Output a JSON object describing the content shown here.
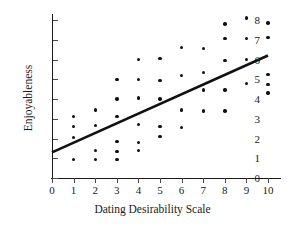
{
  "chart_data": {
    "type": "scatter",
    "title": "",
    "xlabel": "Dating Desirability Scale",
    "ylabel": "Enjoyableness",
    "xlim": [
      0,
      10
    ],
    "ylim": [
      0,
      8
    ],
    "xticks": [
      0,
      1,
      2,
      3,
      4,
      5,
      6,
      7,
      8,
      9,
      10
    ],
    "yticks": [
      0,
      1,
      2,
      3,
      4,
      5,
      6,
      7,
      8
    ],
    "xtick_labels": [
      "0",
      "1",
      "2",
      "3",
      "4",
      "5",
      "6",
      "7",
      "8",
      "9",
      "10"
    ],
    "ytick_labels": [
      "0",
      "1",
      "2",
      "3",
      "4",
      "5",
      "6",
      "7",
      "8"
    ],
    "grid": false,
    "legend": false,
    "marker_color": "#111111",
    "line_color": "#111111",
    "axis_color": "#1a1a1a",
    "background_color": "#ffffff",
    "points": [
      {
        "x": 1,
        "y": 3.1
      },
      {
        "x": 1,
        "y": 2.6
      },
      {
        "x": 1,
        "y": 2.05
      },
      {
        "x": 1,
        "y": 0.95
      },
      {
        "x": 2,
        "y": 3.45
      },
      {
        "x": 2,
        "y": 2.65
      },
      {
        "x": 2,
        "y": 1.4
      },
      {
        "x": 2,
        "y": 0.95
      },
      {
        "x": 3,
        "y": 5.0
      },
      {
        "x": 3,
        "y": 4.0
      },
      {
        "x": 3,
        "y": 3.1
      },
      {
        "x": 3,
        "y": 1.85
      },
      {
        "x": 3,
        "y": 1.35
      },
      {
        "x": 3,
        "y": 0.95
      },
      {
        "x": 4,
        "y": 6.0
      },
      {
        "x": 4,
        "y": 5.0
      },
      {
        "x": 4,
        "y": 4.05
      },
      {
        "x": 4,
        "y": 2.7
      },
      {
        "x": 4,
        "y": 1.8
      },
      {
        "x": 4,
        "y": 1.4
      },
      {
        "x": 5,
        "y": 6.05
      },
      {
        "x": 5,
        "y": 4.95
      },
      {
        "x": 5,
        "y": 4.0
      },
      {
        "x": 5,
        "y": 2.6
      },
      {
        "x": 5,
        "y": 2.1
      },
      {
        "x": 6,
        "y": 6.6
      },
      {
        "x": 6,
        "y": 5.2
      },
      {
        "x": 6,
        "y": 3.45
      },
      {
        "x": 6,
        "y": 2.55
      },
      {
        "x": 7,
        "y": 6.55
      },
      {
        "x": 7,
        "y": 5.35
      },
      {
        "x": 7,
        "y": 4.45
      },
      {
        "x": 7,
        "y": 3.4
      },
      {
        "x": 8,
        "y": 7.8
      },
      {
        "x": 8,
        "y": 7.05
      },
      {
        "x": 8,
        "y": 5.95
      },
      {
        "x": 8,
        "y": 4.45
      },
      {
        "x": 8,
        "y": 3.4
      },
      {
        "x": 9,
        "y": 8.1
      },
      {
        "x": 9,
        "y": 7.05
      },
      {
        "x": 9,
        "y": 6.0
      },
      {
        "x": 9,
        "y": 4.8
      },
      {
        "x": 10,
        "y": 7.85
      },
      {
        "x": 10,
        "y": 7.1
      },
      {
        "x": 10,
        "y": 5.25
      },
      {
        "x": 10,
        "y": 4.75
      },
      {
        "x": 10,
        "y": 4.3
      }
    ],
    "regression_line": {
      "x_start": 0,
      "y_start": 1.3,
      "x_end": 10,
      "y_end": 6.2,
      "slope": 0.49,
      "intercept": 1.3,
      "width_px": 2.6
    }
  }
}
